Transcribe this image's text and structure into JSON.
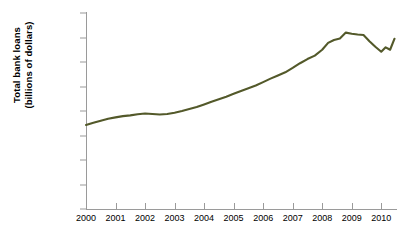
{
  "chart_data": {
    "type": "line",
    "title": "",
    "subtitle": "",
    "xlabel": "",
    "ylabel": "Total bank loans (billions of dollars)",
    "ylabel_line1": "Total bank loans",
    "ylabel_line2": "(billions of dollars)",
    "grid": false,
    "legend": "none",
    "line_color": "#53592a",
    "axis_color": "#9a9a9a",
    "background": "#ffffff",
    "xlim": [
      2000,
      2010.5
    ],
    "ylim": [
      0,
      8000
    ],
    "x_tick_labels": [
      "2000",
      "2001",
      "2002",
      "2003",
      "2004",
      "2005",
      "2006",
      "2007",
      "2008",
      "2009",
      "2010"
    ],
    "x_tick_values": [
      2000,
      2001,
      2002,
      2003,
      2004,
      2005,
      2006,
      2007,
      2008,
      2009,
      2010
    ],
    "y_tick_labels": [
      "0",
      "1,000",
      "2,000",
      "3,000",
      "4,000",
      "5,000",
      "6,000",
      "7,000",
      "$8,000"
    ],
    "y_tick_values": [
      0,
      1000,
      2000,
      3000,
      4000,
      5000,
      6000,
      7000,
      8000
    ],
    "series": [
      {
        "name": "Total bank loans",
        "color": "#53592a",
        "x": [
          2000.0,
          2000.25,
          2000.5,
          2000.75,
          2001.0,
          2001.25,
          2001.5,
          2001.75,
          2002.0,
          2002.25,
          2002.5,
          2002.75,
          2003.0,
          2003.25,
          2003.5,
          2003.75,
          2004.0,
          2004.25,
          2004.5,
          2004.75,
          2005.0,
          2005.25,
          2005.5,
          2005.75,
          2006.0,
          2006.25,
          2006.5,
          2006.75,
          2007.0,
          2007.25,
          2007.5,
          2007.75,
          2008.0,
          2008.2,
          2008.4,
          2008.6,
          2008.8,
          2009.0,
          2009.2,
          2009.4,
          2009.6,
          2009.8,
          2010.0,
          2010.15,
          2010.3,
          2010.45
        ],
        "y": [
          3430,
          3520,
          3600,
          3680,
          3740,
          3790,
          3820,
          3870,
          3900,
          3880,
          3860,
          3880,
          3930,
          4000,
          4080,
          4160,
          4270,
          4380,
          4480,
          4580,
          4700,
          4820,
          4930,
          5040,
          5180,
          5320,
          5450,
          5580,
          5760,
          5950,
          6120,
          6260,
          6500,
          6780,
          6900,
          6960,
          7200,
          7150,
          7120,
          7100,
          6850,
          6620,
          6420,
          6600,
          6500,
          6950
        ]
      }
    ],
    "annotations": []
  }
}
